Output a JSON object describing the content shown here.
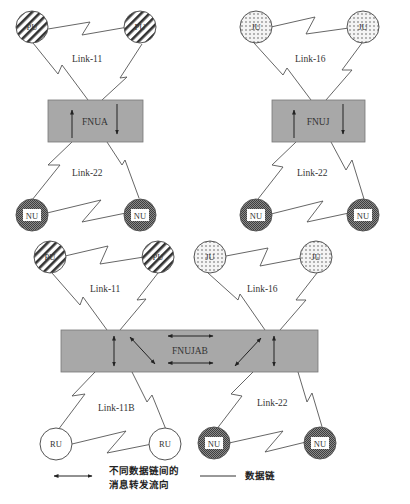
{
  "diagram": {
    "top_left": {
      "units": [
        {
          "label": "PU"
        },
        {
          "label": "PU"
        }
      ],
      "upper_link": "Link-11",
      "gateway": "FNUA",
      "lower_link": "Link-22",
      "lower_units": [
        {
          "label": "NU"
        },
        {
          "label": "NU"
        }
      ]
    },
    "top_right": {
      "units": [
        {
          "label": "JU"
        },
        {
          "label": "JU"
        }
      ],
      "upper_link": "Link-16",
      "gateway": "FNUJ",
      "lower_link": "Link-22",
      "lower_units": [
        {
          "label": "NU"
        },
        {
          "label": "NU"
        }
      ]
    },
    "bottom": {
      "left_units": [
        {
          "label": "PU"
        },
        {
          "label": "PU"
        }
      ],
      "left_upper_link": "Link-11",
      "right_units": [
        {
          "label": "JU"
        },
        {
          "label": "JU"
        }
      ],
      "right_upper_link": "Link-16",
      "gateway": "FNUJAB",
      "left_lower_link": "Link-11B",
      "left_lower_units": [
        {
          "label": "RU"
        },
        {
          "label": "RU"
        }
      ],
      "right_lower_link": "Link-22",
      "right_lower_units": [
        {
          "label": "NU"
        },
        {
          "label": "NU"
        }
      ]
    }
  },
  "legend": {
    "arrow_line1": "不同数据链间的",
    "arrow_line2": "消息转发流向",
    "line_label": "数据链"
  },
  "colors": {
    "gateway_fill": "#a8a8a8",
    "pu_hatch": "#333333",
    "ju_dots": "#555555",
    "nu_fill": "#6e6e6e",
    "ru_fill": "#ffffff"
  }
}
